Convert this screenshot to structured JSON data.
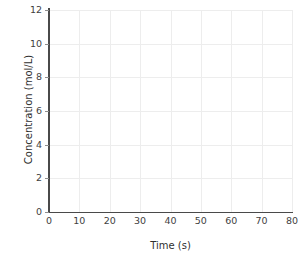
{
  "chart_data": {
    "type": "line",
    "title": "",
    "subtitle": "",
    "xlabel": "Time (s)",
    "ylabel": "Concentration (mol/L)",
    "xlim": [
      0,
      80
    ],
    "ylim": [
      0,
      12
    ],
    "xticks": [
      0,
      10,
      20,
      30,
      40,
      50,
      60,
      70,
      80
    ],
    "yticks": [
      0,
      2,
      4,
      6,
      8,
      10,
      12
    ],
    "xtick_labels": [
      "0",
      "10",
      "20",
      "30",
      "40",
      "50",
      "60",
      "70",
      "80"
    ],
    "ytick_labels": [
      "0",
      "2",
      "4",
      "6",
      "8",
      "10",
      "12"
    ],
    "grid": true,
    "legend": null,
    "series": [],
    "annotations": [],
    "note": "Empty plot grid — no data series are drawn in the figure.",
    "colors": {
      "background": "#ffffff",
      "gridline": "#ededed",
      "spine": "#4a4a4a",
      "tick_label": "#3f3f3f",
      "axis_title": "#2f2f2f"
    }
  }
}
